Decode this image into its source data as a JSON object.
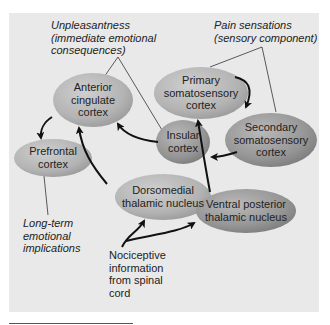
{
  "diagram": {
    "nodes": {
      "anterior_cingulate": "Anterior cingulate cortex",
      "primary_somatosensory": "Primary somatosensory cortex",
      "secondary_somatosensory": "Secondary somatosensory cortex",
      "insular": "Insular cortex",
      "prefrontal": "Prefrontal cortex",
      "dorsomedial": "Dorsomedial thalamic nucleus",
      "ventral_posterior": "Ventral posterior thalamic nucleus"
    },
    "node_lines": {
      "anterior_cingulate": [
        "Anterior",
        "cingulate",
        "cortex"
      ],
      "primary_somatosensory": [
        "Primary",
        "somatosensory",
        "cortex"
      ],
      "secondary_somatosensory": [
        "Secondary",
        "somatosensory",
        "cortex"
      ],
      "insular": [
        "Insular",
        "cortex"
      ],
      "prefrontal": [
        "Prefrontal",
        "cortex"
      ],
      "dorsomedial": [
        "Dorsomedial",
        "thalamic nucleus"
      ],
      "ventral_posterior": [
        "Ventral posterior",
        "thalamic nucleus"
      ]
    },
    "annotations": {
      "unpleasantness": [
        "Unpleasantness",
        "(immediate emotional",
        "consequences)"
      ],
      "pain_sensations": [
        "Pain sensations",
        "(sensory component)"
      ],
      "long_term": [
        "Long-term",
        "emotional",
        "implications"
      ]
    },
    "input": [
      "Nociceptive",
      "information",
      "from spinal",
      "cord"
    ],
    "edges": [
      {
        "from": "Nociceptive information",
        "to": "Dorsomedial thalamic nucleus"
      },
      {
        "from": "Nociceptive information",
        "to": "Ventral posterior thalamic nucleus"
      },
      {
        "from": "Dorsomedial thalamic nucleus",
        "to": "Anterior cingulate cortex"
      },
      {
        "from": "Ventral posterior thalamic nucleus",
        "to": "Primary somatosensory cortex"
      },
      {
        "from": "Primary somatosensory cortex",
        "to": "Secondary somatosensory cortex"
      },
      {
        "from": "Secondary somatosensory cortex",
        "to": "Insular cortex"
      },
      {
        "from": "Insular cortex",
        "to": "Anterior cingulate cortex"
      },
      {
        "from": "Anterior cingulate cortex",
        "to": "Prefrontal cortex"
      }
    ],
    "colors": {
      "panel": "#e9e9e9",
      "node_fill": "#b8b8b8",
      "node_dark": "#8c8c8c",
      "arrow": "#111111",
      "text": "#222222"
    }
  }
}
